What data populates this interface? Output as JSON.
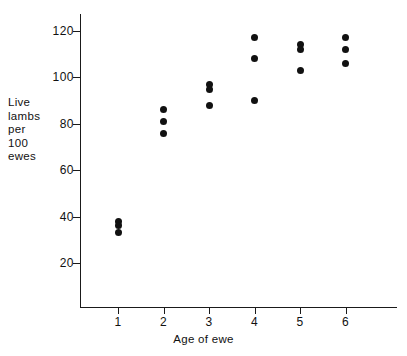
{
  "chart_data": {
    "type": "scatter",
    "title": "",
    "xlabel": "Age of ewe",
    "ylabel": "Live\nlambs\nper\n100\newes",
    "xlim": [
      0.35,
      6.9
    ],
    "ylim": [
      0,
      128
    ],
    "grid": false,
    "legend": null,
    "xticks": [
      1,
      2,
      3,
      4,
      5,
      6
    ],
    "xtick_labels": [
      "1",
      "2",
      "3",
      "4",
      "5",
      "6"
    ],
    "yticks": [
      20,
      40,
      60,
      80,
      100,
      120
    ],
    "ytick_labels": [
      "20",
      "40",
      "60",
      "80",
      "100",
      "120"
    ],
    "marker": {
      "shape": "circle",
      "color": "#111111",
      "size_px": 7
    },
    "categories": [
      1,
      2,
      3,
      4,
      5,
      6
    ],
    "series": [
      {
        "name": "observation 1",
        "x": [
          1,
          2,
          3,
          4,
          5,
          6
        ],
        "values": [
          38,
          86,
          97,
          117,
          114,
          117
        ]
      },
      {
        "name": "observation 2",
        "x": [
          1,
          2,
          3,
          4,
          5,
          6
        ],
        "values": [
          36,
          81,
          95,
          108,
          112,
          112
        ]
      },
      {
        "name": "observation 3",
        "x": [
          1,
          2,
          3,
          4,
          5,
          6
        ],
        "values": [
          33,
          76,
          88,
          90,
          103,
          106
        ]
      }
    ],
    "points": [
      {
        "x": 1,
        "y": 38
      },
      {
        "x": 1,
        "y": 36
      },
      {
        "x": 1,
        "y": 33
      },
      {
        "x": 2,
        "y": 86
      },
      {
        "x": 2,
        "y": 81
      },
      {
        "x": 2,
        "y": 76
      },
      {
        "x": 3,
        "y": 97
      },
      {
        "x": 3,
        "y": 95
      },
      {
        "x": 3,
        "y": 88
      },
      {
        "x": 4,
        "y": 117
      },
      {
        "x": 4,
        "y": 108
      },
      {
        "x": 4,
        "y": 90
      },
      {
        "x": 5,
        "y": 114
      },
      {
        "x": 5,
        "y": 112
      },
      {
        "x": 5,
        "y": 103
      },
      {
        "x": 6,
        "y": 117
      },
      {
        "x": 6,
        "y": 112
      },
      {
        "x": 6,
        "y": 106
      }
    ]
  },
  "colors": {
    "axis": "#1a1a1a",
    "marker": "#111111",
    "background": "#ffffff",
    "text": "#111111"
  }
}
